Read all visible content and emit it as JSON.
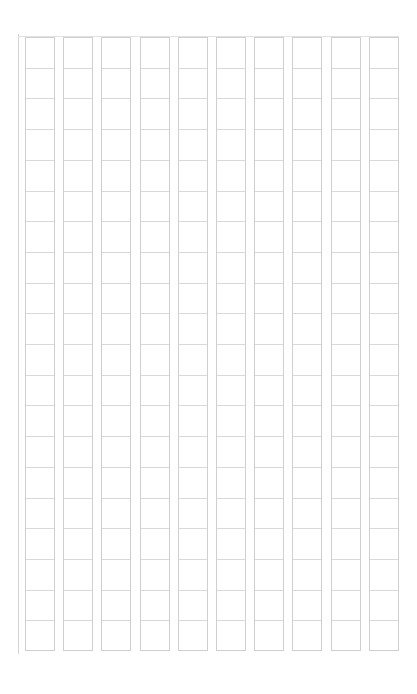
{
  "document": {
    "type": "manuscript-grid-paper",
    "columns": 10,
    "rows": 20,
    "grid": {
      "left": 25,
      "top": 37,
      "cell_width": 30,
      "column_pitch": 38.2,
      "row_pitch": 30.7,
      "height": 614
    },
    "colors": {
      "line": "#cfcfcf",
      "row_line": "#d9d9d9",
      "background": "#ffffff"
    }
  }
}
